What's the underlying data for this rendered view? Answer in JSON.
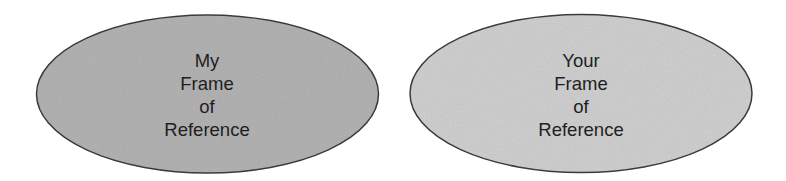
{
  "diagram": {
    "shapes": [
      {
        "id": "my-frame",
        "type": "ellipse",
        "lines": [
          "My",
          "Frame",
          "of",
          "Reference"
        ],
        "fill": "#b5b5b5",
        "stroke": "#3a3a3a"
      },
      {
        "id": "your-frame",
        "type": "ellipse",
        "lines": [
          "Your",
          "Frame",
          "of",
          "Reference"
        ],
        "fill": "#d2d2d2",
        "stroke": "#3a3a3a"
      }
    ]
  }
}
